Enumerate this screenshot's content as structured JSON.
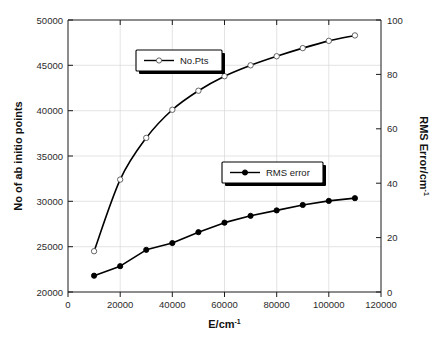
{
  "chart_data": {
    "type": "line",
    "title": "",
    "xlabel": "E/cm-1",
    "xlabel_base": "E/cm",
    "xlabel_sup": "-1",
    "ylabel_left": "No of ab initio points",
    "ylabel_right": "RMS Error/cm-1",
    "ylabel_right_base": "RMS Error/cm",
    "ylabel_right_sup": "-1",
    "x": [
      10000,
      20000,
      30000,
      40000,
      50000,
      60000,
      70000,
      80000,
      90000,
      100000,
      110000
    ],
    "xlim": [
      0,
      120000
    ],
    "xticks": [
      0,
      20000,
      40000,
      60000,
      80000,
      100000,
      120000
    ],
    "xticklabels": [
      "0",
      "20000",
      "40000",
      "60000",
      "80000",
      "100000",
      "120000"
    ],
    "ylim_left": [
      20000,
      50000
    ],
    "yticks_left": [
      20000,
      25000,
      30000,
      35000,
      40000,
      45000,
      50000
    ],
    "yticklabels_left": [
      "20000",
      "25000",
      "30000",
      "35000",
      "40000",
      "45000",
      "50000"
    ],
    "ylim_right": [
      0,
      100
    ],
    "yticks_right": [
      0,
      20,
      40,
      60,
      80,
      100
    ],
    "yticklabels_right": [
      "0",
      "20",
      "40",
      "60",
      "80",
      "100"
    ],
    "grid": true,
    "legend_position": "inside",
    "series": [
      {
        "name": "No.Pts",
        "axis": "left",
        "marker": "open-circle",
        "color": "#000000",
        "values": [
          24500,
          32400,
          37000,
          40100,
          42200,
          43800,
          45000,
          46000,
          46900,
          47700,
          48300
        ]
      },
      {
        "name": "RMS error",
        "axis": "right",
        "marker": "filled-circle",
        "color": "#000000",
        "values": [
          6.0,
          9.5,
          15.5,
          18.0,
          22.0,
          25.5,
          28.0,
          30.0,
          32.0,
          33.5,
          34.5
        ]
      }
    ]
  },
  "legend": {
    "nopts": {
      "label": "No.Pts"
    },
    "rms": {
      "label": "RMS error"
    }
  }
}
